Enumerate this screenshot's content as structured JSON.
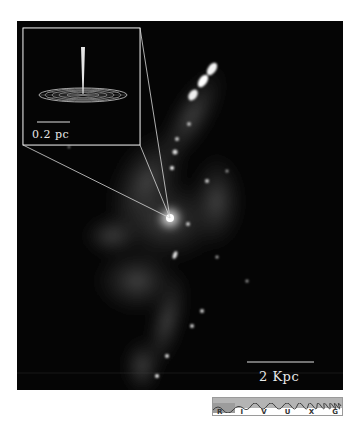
{
  "figure": {
    "inset": {
      "scale_label": "0.2 pc",
      "content": "accretion-disk-with-jet"
    },
    "main": {
      "scale_label": "2 Kpc"
    },
    "spectrum_bar": {
      "bands": [
        "R",
        "I",
        "V",
        "U",
        "X",
        "G"
      ],
      "highlighted_band": "R"
    },
    "colors": {
      "background": "#ffffff",
      "photo_background": "#050505",
      "annotation_lines": "#d8d8d8",
      "spectrum_fill": "#b4b4b4"
    }
  }
}
